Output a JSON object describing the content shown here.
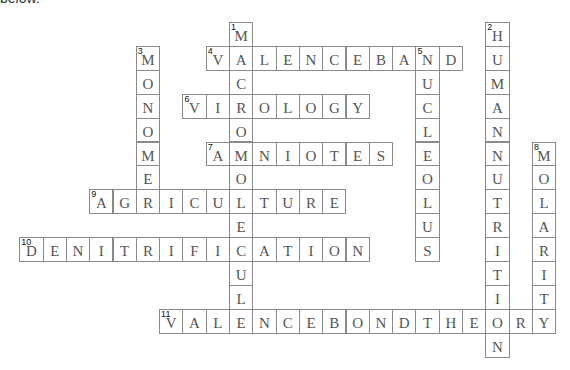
{
  "header": {
    "cut_text": "below."
  },
  "grid": {
    "origin_x": 19.3,
    "origin_y": 22,
    "cell_w": 23.3,
    "cell_h": 23.9
  },
  "words": [
    {
      "number": "1",
      "answer": "MACROMOLECULE",
      "direction": "down",
      "col": 9,
      "row": 0
    },
    {
      "number": "2",
      "answer": "HUMANNUTRITION",
      "direction": "down",
      "col": 20,
      "row": 0
    },
    {
      "number": "3",
      "answer": "MONOMER",
      "direction": "down",
      "col": 5,
      "row": 1
    },
    {
      "number": "4",
      "answer": "VALENCEBAND",
      "direction": "across",
      "col": 8,
      "row": 1
    },
    {
      "number": "5",
      "answer": "NUCLEOLUS",
      "direction": "down",
      "col": 17,
      "row": 1
    },
    {
      "number": "6",
      "answer": "VIROLOGY",
      "direction": "across",
      "col": 7,
      "row": 3
    },
    {
      "number": "7",
      "answer": "AMNIOTES",
      "direction": "across",
      "col": 8,
      "row": 5
    },
    {
      "number": "8",
      "answer": "MOLARITY",
      "direction": "down",
      "col": 22,
      "row": 5
    },
    {
      "number": "9",
      "answer": "AGRICULTURE",
      "direction": "across",
      "col": 3,
      "row": 7
    },
    {
      "number": "10",
      "answer": "DENITRIFICATION",
      "direction": "across",
      "col": 0,
      "row": 9
    },
    {
      "number": "11",
      "answer": "VALENCEBONDTHEORY",
      "direction": "across",
      "col": 6,
      "row": 12
    }
  ]
}
